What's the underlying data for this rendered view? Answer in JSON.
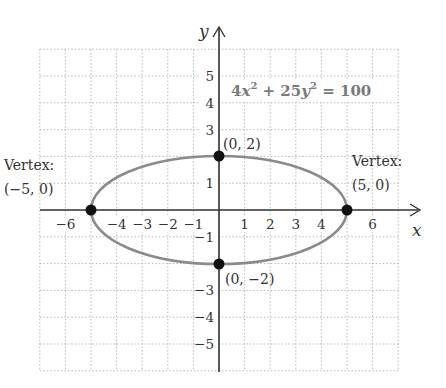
{
  "chart_data": {
    "type": "diagram",
    "title": "",
    "equation": {
      "text": "4x² + 25y² = 100",
      "parts": [
        "4",
        "x",
        "2",
        " + 25",
        "y",
        "2",
        " = 100"
      ]
    },
    "axes": {
      "x_label": "x",
      "y_label": "y",
      "xlim": [
        -7,
        7
      ],
      "ylim": [
        -6,
        6
      ],
      "grid": true
    },
    "x_ticks": [
      {
        "v": -6,
        "label": "−6"
      },
      {
        "v": -4,
        "label": "−4"
      },
      {
        "v": -3,
        "label": "−3"
      },
      {
        "v": -2,
        "label": "−2"
      },
      {
        "v": -1,
        "label": "−1"
      },
      {
        "v": 1,
        "label": "1"
      },
      {
        "v": 2,
        "label": "2"
      },
      {
        "v": 3,
        "label": "3"
      },
      {
        "v": 4,
        "label": "4"
      },
      {
        "v": 6,
        "label": "6"
      }
    ],
    "y_ticks": [
      {
        "v": 5,
        "label": "5"
      },
      {
        "v": 4,
        "label": "4"
      },
      {
        "v": 3,
        "label": "3"
      },
      {
        "v": 1,
        "label": "1"
      },
      {
        "v": -1,
        "label": "−1"
      },
      {
        "v": -3,
        "label": "−3"
      },
      {
        "v": -4,
        "label": "−4"
      },
      {
        "v": -5,
        "label": "−5"
      }
    ],
    "curve": {
      "kind": "ellipse",
      "center": [
        0,
        0
      ],
      "a": 5,
      "b": 2,
      "color": "#8a8a8a"
    },
    "points": [
      {
        "x": -5,
        "y": 0,
        "label_line1": "Vertex:",
        "label_line2": "(−5, 0)"
      },
      {
        "x": 5,
        "y": 0,
        "label_line1": "Vertex:",
        "label_line2": "(5, 0)"
      },
      {
        "x": 0,
        "y": 2,
        "label_line1": "(0, 2)",
        "label_line2": ""
      },
      {
        "x": 0,
        "y": -2,
        "label_line1": "(0, −2)",
        "label_line2": ""
      }
    ]
  },
  "labels": {
    "vertex_left_1": "Vertex:",
    "vertex_left_2": "(−5, 0)",
    "vertex_right_1": "Vertex:",
    "vertex_right_2": "(5, 0)",
    "covertex_top": "(0, 2)",
    "covertex_bottom": "(0, −2)",
    "x_axis": "x",
    "y_axis": "y",
    "eq_coef1": "4",
    "eq_var1": "x",
    "eq_exp1": "2",
    "eq_mid": " + 25",
    "eq_var2": "y",
    "eq_exp2": "2",
    "eq_rhs": " = 100"
  },
  "colors": {
    "curve": "#8a8a8a",
    "axis": "#333333",
    "grid": "#b8b8b8",
    "point": "#111111",
    "equation": "#7a7a7a"
  }
}
